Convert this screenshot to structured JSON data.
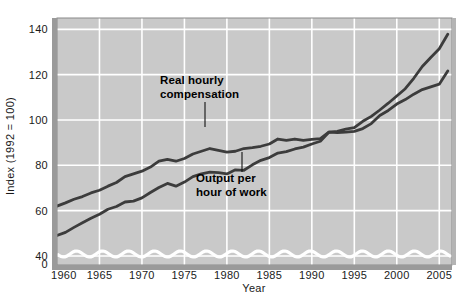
{
  "chart_data": {
    "type": "line",
    "title": "",
    "xlabel": "Year",
    "ylabel": "Index (1992 = 100)",
    "xlim": [
      1960,
      2006.5
    ],
    "ylim": [
      36,
      145
    ],
    "ylim_display": [
      0,
      140
    ],
    "grid": true,
    "legend_position": "inline-annotations",
    "axis_break": {
      "present": true,
      "between": [
        0,
        40
      ],
      "style": "wavy-white-line"
    },
    "xticks": [
      1960,
      1965,
      1970,
      1975,
      1980,
      1985,
      1990,
      1995,
      2000,
      2005
    ],
    "xtick_labels": [
      "1960",
      "1965",
      "1970",
      "1975",
      "1980",
      "1985",
      "1990",
      "1995",
      "2000",
      "2005"
    ],
    "yticks": [
      0,
      40,
      60,
      80,
      100,
      120,
      140
    ],
    "ytick_labels": [
      "0",
      "40",
      "60",
      "80",
      "100",
      "120",
      "140"
    ],
    "x": [
      1960,
      1961,
      1962,
      1963,
      1964,
      1965,
      1966,
      1967,
      1968,
      1969,
      1970,
      1971,
      1972,
      1973,
      1974,
      1975,
      1976,
      1977,
      1978,
      1979,
      1980,
      1981,
      1982,
      1983,
      1984,
      1985,
      1986,
      1987,
      1988,
      1989,
      1990,
      1991,
      1992,
      1993,
      1994,
      1995,
      1996,
      1997,
      1998,
      1999,
      2000,
      2001,
      2002,
      2003,
      2004,
      2005,
      2006
    ],
    "series": [
      {
        "name": "Real hourly compensation",
        "color": "#3c3c3c",
        "values": [
          62.0,
          63.4,
          65.0,
          66.2,
          67.8,
          69.0,
          70.8,
          72.4,
          75.0,
          76.2,
          77.4,
          79.2,
          81.8,
          82.6,
          81.8,
          83.0,
          85.0,
          86.2,
          87.4,
          86.6,
          85.8,
          86.2,
          87.4,
          87.8,
          88.4,
          89.4,
          91.6,
          91.0,
          91.6,
          91.0,
          91.4,
          91.8,
          94.6,
          94.4,
          94.6,
          95.0,
          96.2,
          98.4,
          102.0,
          104.2,
          107.0,
          109.0,
          111.4,
          113.4,
          114.6,
          115.8,
          121.6
        ]
      },
      {
        "name": "Output per hour of work",
        "color": "#3c3c3c",
        "values": [
          49.0,
          50.4,
          52.6,
          54.6,
          56.6,
          58.4,
          60.6,
          61.8,
          63.8,
          64.2,
          65.6,
          68.0,
          70.2,
          72.0,
          70.8,
          72.6,
          75.0,
          76.2,
          77.0,
          76.8,
          76.2,
          78.0,
          77.8,
          80.2,
          82.2,
          83.4,
          85.4,
          86.0,
          87.2,
          88.0,
          89.4,
          90.6,
          94.6,
          95.0,
          96.0,
          96.6,
          99.4,
          101.6,
          104.4,
          107.4,
          110.6,
          113.8,
          118.4,
          123.6,
          127.6,
          131.4,
          137.8
        ]
      }
    ],
    "annotations": [
      {
        "name": "real-hourly-compensation",
        "line1": "Real hourly",
        "line2": "compensation",
        "text_x": 160,
        "text_y": 84,
        "leader_x": 205,
        "leader_y1": 102,
        "leader_y2": 127
      },
      {
        "name": "output-per-hour-of-work",
        "line1": "Output per",
        "line2": "hour of work",
        "text_x": 196,
        "text_y": 182,
        "leader_x": 242,
        "leader_y1": 172,
        "leader_y2": 152
      }
    ],
    "colors": {
      "plot_background": "#c9c9c9",
      "gridline": "#ffffff",
      "line": "#3c3c3c",
      "border": "#7a7a7a",
      "text": "#1a1a1a",
      "page_background": "#ffffff"
    }
  }
}
